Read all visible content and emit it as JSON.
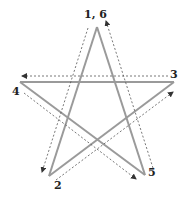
{
  "diagram": {
    "type": "pentagram-stroke-order",
    "colors": {
      "star_line": "#9a9a9a",
      "dashed_path": "#555555",
      "label": "#222222"
    },
    "vertices": [
      {
        "id": "v1",
        "x": 97,
        "y": 27
      },
      {
        "id": "v2",
        "x": 49,
        "y": 176
      },
      {
        "id": "v3",
        "x": 174,
        "y": 82
      },
      {
        "id": "v4",
        "x": 20,
        "y": 82
      },
      {
        "id": "v5",
        "x": 145,
        "y": 175
      }
    ],
    "labels": [
      {
        "text": "1, 6",
        "x": 84,
        "y": 18
      },
      {
        "text": "2",
        "x": 54,
        "y": 189
      },
      {
        "text": "3",
        "x": 170,
        "y": 78
      },
      {
        "text": "4",
        "x": 12,
        "y": 95
      },
      {
        "text": "5",
        "x": 148,
        "y": 176
      }
    ]
  }
}
